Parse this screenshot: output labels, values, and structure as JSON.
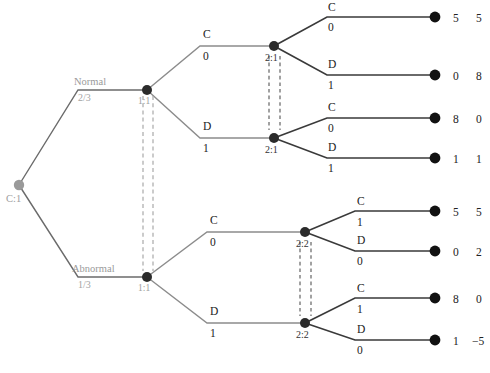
{
  "diagram": {
    "type": "game-tree",
    "colors": {
      "edge_dark": "#3a3a3a",
      "edge_gray": "#8c8c8c",
      "chance_node": "#9a9a9a",
      "terminal_node": "#111111",
      "decision_node": "#2b2b2b",
      "infoset_gray": "#a9a9a9",
      "infoset_dark": "#555555",
      "background": "#ffffff"
    }
  },
  "root": {
    "label": "C:1",
    "node_kind": "chance"
  },
  "chance_branches": [
    {
      "id": "normal",
      "name": "Normal",
      "probability": "2/3"
    },
    {
      "id": "abnormal",
      "name": "Abnormal",
      "probability": "1/3"
    }
  ],
  "player1_nodes": [
    {
      "id": "p1-normal",
      "label": "1:1"
    },
    {
      "id": "p1-abnormal",
      "label": "1:1"
    }
  ],
  "player2_nodes": [
    {
      "id": "p2-n-c",
      "label": "2:1"
    },
    {
      "id": "p2-n-d",
      "label": "2:1"
    },
    {
      "id": "p2-a-c",
      "label": "2:2"
    },
    {
      "id": "p2-a-d",
      "label": "2:2"
    }
  ],
  "player1_actions": [
    {
      "id": "a-n-c",
      "action": "C",
      "signal": "0"
    },
    {
      "id": "a-n-d",
      "action": "D",
      "signal": "1"
    },
    {
      "id": "a-a-c",
      "action": "C",
      "signal": "0"
    },
    {
      "id": "a-a-d",
      "action": "D",
      "signal": "1"
    }
  ],
  "player2_actions": [
    {
      "id": "b-nc-c",
      "action": "C",
      "signal": "0"
    },
    {
      "id": "b-nc-d",
      "action": "D",
      "signal": "1"
    },
    {
      "id": "b-nd-c",
      "action": "C",
      "signal": "0"
    },
    {
      "id": "b-nd-d",
      "action": "D",
      "signal": "1"
    },
    {
      "id": "b-ac-c",
      "action": "C",
      "signal": "1"
    },
    {
      "id": "b-ac-d",
      "action": "D",
      "signal": "0"
    },
    {
      "id": "b-ad-c",
      "action": "C",
      "signal": "1"
    },
    {
      "id": "b-ad-d",
      "action": "D",
      "signal": "0"
    }
  ],
  "outcomes": [
    {
      "id": "t1",
      "p1": "5",
      "p2": "5"
    },
    {
      "id": "t2",
      "p1": "0",
      "p2": "8"
    },
    {
      "id": "t3",
      "p1": "8",
      "p2": "0"
    },
    {
      "id": "t4",
      "p1": "1",
      "p2": "1"
    },
    {
      "id": "t5",
      "p1": "5",
      "p2": "5"
    },
    {
      "id": "t6",
      "p1": "0",
      "p2": "2"
    },
    {
      "id": "t7",
      "p1": "8",
      "p2": "0"
    },
    {
      "id": "t8",
      "p1": "1",
      "p2": "−5"
    }
  ],
  "information_sets": [
    {
      "id": "is-p1",
      "label": "1:1",
      "style": "gray-double-dashed"
    },
    {
      "id": "is-p2-normal",
      "label": "2:1",
      "style": "dark-double-dashed"
    },
    {
      "id": "is-p2-abnormal",
      "label": "2:2",
      "style": "dark-double-dashed"
    }
  ]
}
